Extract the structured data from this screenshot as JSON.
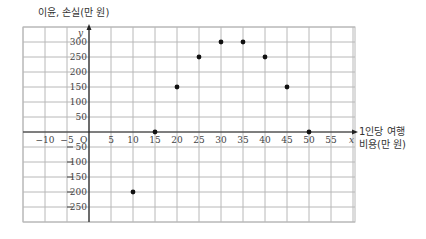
{
  "chart_data": {
    "type": "scatter",
    "title": "",
    "ylabel": "이윤, 손실(만 원)",
    "xlabel_line1": "1인당 여행",
    "xlabel_line2": "비용(만 원)",
    "x_axis_letter": "x",
    "y_axis_letter": "y",
    "origin_label": "O",
    "xlim": [
      -15,
      60
    ],
    "ylim": [
      -300,
      350
    ],
    "x_ticks": [
      -10,
      -5,
      5,
      10,
      15,
      20,
      25,
      30,
      35,
      40,
      45,
      50,
      55
    ],
    "x_tick_labels": [
      "−10",
      "−5",
      "5",
      "10",
      "15",
      "20",
      "25",
      "30",
      "35",
      "40",
      "45",
      "50",
      "55"
    ],
    "y_ticks": [
      300,
      250,
      200,
      150,
      100,
      50,
      -50,
      -100,
      -150,
      -200,
      -250
    ],
    "y_tick_labels": [
      "300",
      "250",
      "200",
      "150",
      "100",
      "50",
      "50",
      "100",
      "150",
      "200",
      "250"
    ],
    "grid": true,
    "points": [
      {
        "x": 10,
        "y": -200
      },
      {
        "x": 15,
        "y": 0
      },
      {
        "x": 20,
        "y": 150
      },
      {
        "x": 25,
        "y": 250
      },
      {
        "x": 30,
        "y": 300
      },
      {
        "x": 35,
        "y": 300
      },
      {
        "x": 40,
        "y": 250
      },
      {
        "x": 45,
        "y": 150
      },
      {
        "x": 50,
        "y": 0
      }
    ]
  },
  "colors": {
    "grid": "#b8b8b8",
    "axis": "#222222",
    "point": "#111111"
  }
}
